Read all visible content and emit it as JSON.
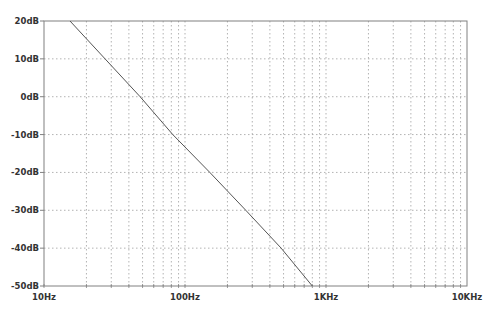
{
  "chart_data": {
    "type": "line",
    "title": "",
    "xlabel": "",
    "ylabel": "",
    "x_scale": "log",
    "xlim": [
      10,
      10000
    ],
    "ylim": [
      -50,
      20
    ],
    "x_ticks": [
      {
        "value": 10,
        "label": "10Hz"
      },
      {
        "value": 100,
        "label": "100Hz"
      },
      {
        "value": 1000,
        "label": "1KHz"
      },
      {
        "value": 10000,
        "label": "10KHz"
      }
    ],
    "y_ticks": [
      {
        "value": 20,
        "label": "20dB"
      },
      {
        "value": 10,
        "label": "10dB"
      },
      {
        "value": 0,
        "label": "0dB"
      },
      {
        "value": -10,
        "label": "-10dB"
      },
      {
        "value": -20,
        "label": "-20dB"
      },
      {
        "value": -30,
        "label": "-30dB"
      },
      {
        "value": -40,
        "label": "-40dB"
      },
      {
        "value": -50,
        "label": "-50dB"
      }
    ],
    "grid": true,
    "grid_style": "dotted",
    "legend": [],
    "series": [
      {
        "name": "magnitude",
        "color": "#555555",
        "x": [
          15.3,
          48,
          82,
          150,
          270,
          480,
          800
        ],
        "y": [
          20,
          0,
          -10,
          -20,
          -30,
          -40,
          -50
        ]
      }
    ]
  },
  "colors": {
    "background": "#ffffff",
    "axis": "#808080",
    "grid": "#a0a0a0",
    "trace": "#555555",
    "label": "#333333"
  }
}
